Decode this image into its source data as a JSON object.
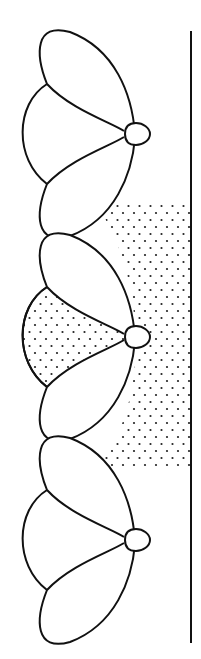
{
  "diagram": {
    "units": [
      {
        "id": "top",
        "node": [
          137,
          134
        ],
        "wedge_stippled": false
      },
      {
        "id": "middle",
        "node": [
          137,
          337
        ],
        "wedge_stippled": true
      },
      {
        "id": "bottom",
        "node": [
          137,
          540
        ],
        "wedge_stippled": false
      }
    ],
    "vertical_line": {
      "x": 191,
      "y_top": 31,
      "y_bottom": 643
    },
    "stipple_region": {
      "y_top": 204,
      "y_bottom": 470
    },
    "colors": {
      "stroke": "#111111",
      "background": "#ffffff",
      "stipple": "#222222"
    }
  }
}
